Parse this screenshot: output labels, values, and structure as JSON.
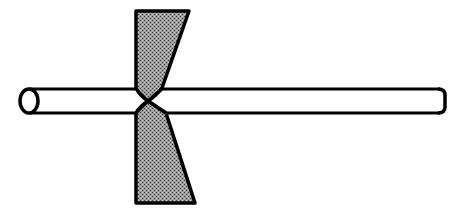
{
  "diagram": {
    "title": "Rod being pinched (drawn) between two tapered dies",
    "elements": {
      "rod": {
        "label": "cylindrical rod",
        "color": "#000000"
      },
      "upper_die": {
        "label": "upper die (shaded, tapered)",
        "fill": "#8a8a8a"
      },
      "lower_die": {
        "label": "lower die (shaded, tapered)",
        "fill": "#8a8a8a"
      },
      "pinch_point": {
        "label": "neck / pinch point"
      }
    },
    "colors": {
      "stroke": "#000000",
      "background": "#ffffff",
      "shade": "#8a8a8a"
    }
  }
}
